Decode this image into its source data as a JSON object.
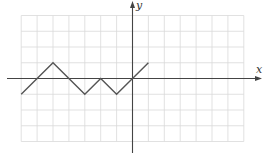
{
  "chart_data": {
    "type": "line",
    "title": "",
    "xlabel": "x",
    "ylabel": "y",
    "xlim": [
      -7,
      7
    ],
    "ylim": [
      -4,
      4
    ],
    "grid": true,
    "legend": null,
    "series": [
      {
        "name": "piecewise-linear graph",
        "x": [
          -7,
          -5,
          -3,
          -2,
          -1,
          1
        ],
        "y": [
          -1,
          1,
          -1,
          0,
          -1,
          1
        ]
      }
    ]
  },
  "colors": {
    "grid": "#d9d9d9",
    "axis": "#444444",
    "line": "#555555"
  },
  "labels": {
    "x_axis": "x",
    "y_axis": "y"
  }
}
